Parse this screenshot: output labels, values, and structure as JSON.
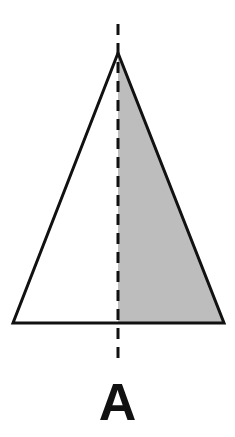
{
  "diagram": {
    "label": "A",
    "colors": {
      "outline": "#111111",
      "shaded_fill": "#bdbdbd",
      "background": "#ffffff"
    },
    "triangle": {
      "apex": [
        118,
        53
      ],
      "base_left": [
        13,
        323
      ],
      "base_right": [
        224,
        323
      ]
    },
    "axis": {
      "x": 118,
      "y_start": 24,
      "y_end": 366,
      "style": "dashed"
    },
    "shaded_half": "right"
  }
}
